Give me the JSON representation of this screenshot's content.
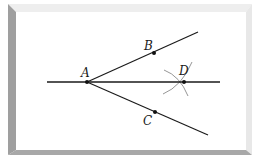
{
  "diagram": {
    "colors": {
      "line": "#1a1a1a",
      "arc": "#8a8a8a",
      "point": "#111111",
      "frame_dark": "#9a9a9a",
      "frame_light": "#e6e6e6",
      "background": "#ffffff"
    },
    "points": [
      {
        "id": "A",
        "label": "A",
        "x": 87,
        "y": 82,
        "label_x": 81,
        "label_y": 77
      },
      {
        "id": "B",
        "label": "B",
        "x": 154,
        "y": 53,
        "label_x": 144,
        "label_y": 50
      },
      {
        "id": "C",
        "label": "C",
        "x": 155,
        "y": 112,
        "label_x": 143,
        "label_y": 125
      },
      {
        "id": "D",
        "label": "D",
        "x": 184,
        "y": 82,
        "label_x": 179,
        "label_y": 75
      }
    ],
    "lines": [
      {
        "id": "horizontal-line-AD",
        "x1": 47,
        "y1": 82,
        "x2": 220,
        "y2": 82
      },
      {
        "id": "ray-AB",
        "x1": 87,
        "y1": 82,
        "x2": 198,
        "y2": 32
      },
      {
        "id": "ray-AC",
        "x1": 87,
        "y1": 82,
        "x2": 208,
        "y2": 135
      }
    ],
    "arcs": [
      {
        "id": "arc-from-B",
        "d": "M 164 70 Q 180 76 188 96"
      },
      {
        "id": "arc-from-C",
        "d": "M 163 94 Q 182 86 192 62"
      }
    ]
  }
}
